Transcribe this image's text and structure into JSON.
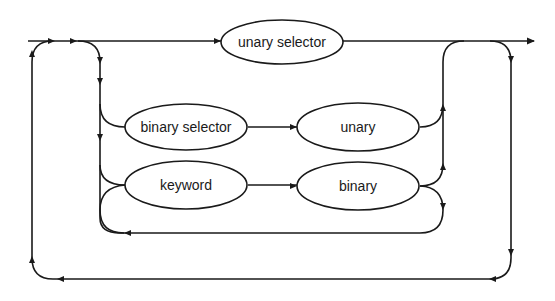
{
  "diagram": {
    "type": "syntax-diagram",
    "nodes": [
      {
        "id": "unary_selector",
        "label": "unary selector"
      },
      {
        "id": "binary_selector",
        "label": "binary selector"
      },
      {
        "id": "unary",
        "label": "unary"
      },
      {
        "id": "keyword",
        "label": "keyword"
      },
      {
        "id": "binary",
        "label": "binary"
      }
    ],
    "edges": [
      {
        "from": "entry",
        "to": "unary_selector"
      },
      {
        "from": "unary_selector",
        "to": "exit"
      },
      {
        "from": "entry",
        "to": "binary_selector"
      },
      {
        "from": "binary_selector",
        "to": "unary"
      },
      {
        "from": "unary",
        "to": "exit"
      },
      {
        "from": "entry",
        "to": "keyword"
      },
      {
        "from": "keyword",
        "to": "binary"
      },
      {
        "from": "binary",
        "to": "exit"
      },
      {
        "from": "binary",
        "to": "keyword",
        "note": "loop back"
      },
      {
        "from": "exit",
        "to": "entry",
        "note": "outer repeat loop"
      }
    ]
  }
}
